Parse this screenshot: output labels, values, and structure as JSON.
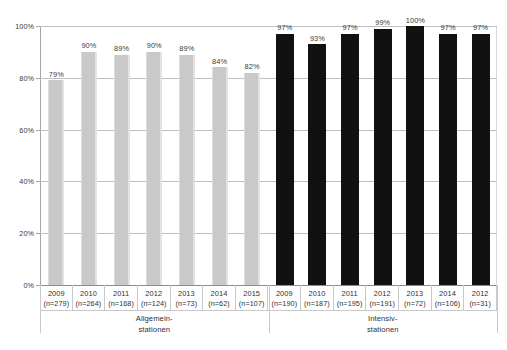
{
  "chart_data": {
    "type": "bar",
    "title": "",
    "subtitle": "",
    "xlabel": "",
    "ylabel": "",
    "ylim": [
      0,
      100
    ],
    "ytick_values": [
      100,
      80,
      60,
      40,
      20,
      0
    ],
    "ytick_labels": [
      "100%",
      "80%",
      "60%",
      "40%",
      "20%",
      "0%"
    ],
    "grid": true,
    "legend": "none",
    "value_suffix": "%",
    "groups": [
      {
        "name": "Allgemein-\nstationen",
        "name_line1": "Allgemein-",
        "name_line2": "stationen",
        "color": "#c9c9c9",
        "style": "light",
        "categories": [
          "2009",
          "2010",
          "2011",
          "2012",
          "2013",
          "2014",
          "2015"
        ],
        "n": [
          "(n=279)",
          "(n=264)",
          "(n=168)",
          "(n=124)",
          "(n=73)",
          "(n=62)",
          "(n=107)"
        ],
        "values": [
          79,
          90,
          89,
          90,
          89,
          84,
          82
        ],
        "labels": [
          "79%",
          "90%",
          "89%",
          "90%",
          "89%",
          "84%",
          "82%"
        ]
      },
      {
        "name": "Intensiv-\nstationen",
        "name_line1": "Intensiv-",
        "name_line2": "stationen",
        "color": "#111111",
        "style": "dark",
        "categories": [
          "2009",
          "2010",
          "2011",
          "2012",
          "2013",
          "2014",
          "2012"
        ],
        "n": [
          "(n=190)",
          "(n=187)",
          "(n=195)",
          "(n=191)",
          "(n=72)",
          "(n=106)",
          "(n=31)"
        ],
        "values": [
          97,
          93,
          97,
          99,
          100,
          97,
          97
        ],
        "labels": [
          "97%",
          "93%",
          "97%",
          "99%",
          "100%",
          "97%",
          "97%"
        ]
      }
    ]
  },
  "colors": {
    "light_bar": "#c9c9c9",
    "dark_bar": "#111111",
    "gridline": "#bfbfbf",
    "axis": "#a6a6a6",
    "text": "#303030",
    "background": "#ffffff"
  }
}
